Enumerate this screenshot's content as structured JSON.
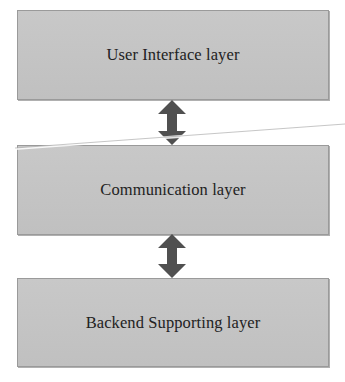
{
  "diagram": {
    "type": "layered-architecture",
    "layers": [
      {
        "id": "ui",
        "label": "User Interface layer"
      },
      {
        "id": "comm",
        "label": "Communication layer"
      },
      {
        "id": "backend",
        "label": "Backend Supporting layer"
      }
    ],
    "connections": [
      {
        "from": "ui",
        "to": "comm",
        "style": "bidirectional-arrow"
      },
      {
        "from": "comm",
        "to": "backend",
        "style": "bidirectional-arrow"
      }
    ],
    "colors": {
      "box_fill": "#c3c3c3",
      "box_border": "#9a9a9a",
      "arrow": "#505050",
      "text": "#222222",
      "background": "#ffffff"
    }
  }
}
